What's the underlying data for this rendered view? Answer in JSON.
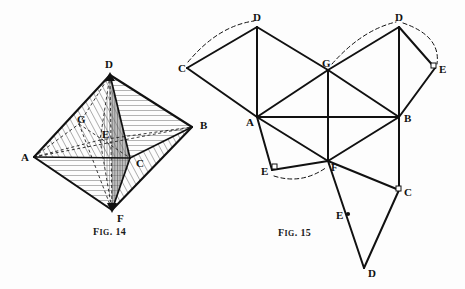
{
  "page": {
    "background_color": "#fdfdfd",
    "ink_color": "#111111",
    "width": 465,
    "height": 289
  },
  "figures": [
    {
      "id": "fig14",
      "caption": "Fig. 14",
      "caption_prefix": "F",
      "caption_small": "IG",
      "caption_suffix": ". 14",
      "caption_x": 115,
      "caption_y": 231,
      "description": "Octahedron drawn in perspective with hatched faces and hidden edges dashed",
      "type": "octahedron-perspective",
      "vertices": [
        {
          "label": "A",
          "x": 34,
          "y": 157,
          "label_x": 21,
          "label_y": 161,
          "visible": true
        },
        {
          "label": "B",
          "x": 192,
          "y": 127,
          "label_x": 200,
          "label_y": 129,
          "visible": true
        },
        {
          "label": "C",
          "x": 130,
          "y": 158,
          "label_x": 136,
          "label_y": 167,
          "visible": true
        },
        {
          "label": "D",
          "x": 110,
          "y": 75,
          "label_x": 106,
          "label_y": 69,
          "visible": true
        },
        {
          "label": "E",
          "x": 100,
          "y": 140,
          "label_x": 103,
          "label_y": 137,
          "visible": false
        },
        {
          "label": "F",
          "x": 112,
          "y": 210,
          "label_x": 117,
          "label_y": 221,
          "visible": true
        },
        {
          "label": "G",
          "x": 79,
          "y": 124,
          "label_x": 80,
          "label_y": 122,
          "visible": false
        }
      ],
      "solid_edges": [
        [
          "A",
          "D"
        ],
        [
          "D",
          "B"
        ],
        [
          "A",
          "F"
        ],
        [
          "F",
          "B"
        ],
        [
          "A",
          "C"
        ],
        [
          "C",
          "B"
        ],
        [
          "D",
          "C"
        ],
        [
          "C",
          "F"
        ]
      ],
      "hidden_edges": [
        [
          "A",
          "B"
        ],
        [
          "D",
          "F"
        ],
        [
          "A",
          "E"
        ],
        [
          "E",
          "B"
        ],
        [
          "D",
          "E"
        ],
        [
          "E",
          "F"
        ],
        [
          "A",
          "G"
        ],
        [
          "G",
          "C"
        ],
        [
          "D",
          "G"
        ],
        [
          "G",
          "F"
        ]
      ],
      "hatched_faces": [
        "A-D-C",
        "D-C-B",
        "A-C-F",
        "C-F-B"
      ]
    },
    {
      "id": "fig15",
      "caption": "Fig. 15",
      "caption_prefix": "F",
      "caption_small": "IG",
      "caption_suffix": ". 15",
      "caption_x": 278,
      "caption_y": 232,
      "description": "Unfolded net of the octahedron made of triangles, with dashed arcs indicating folding/joining of coincident vertices",
      "type": "net-triangulation",
      "vertices": [
        {
          "label": "C",
          "x": 187,
          "y": 68,
          "label_x": 180,
          "label_y": 71,
          "id": "C_left"
        },
        {
          "label": "D",
          "x": 257,
          "y": 27,
          "label_x": 254,
          "label_y": 22,
          "id": "D_topleft"
        },
        {
          "label": "G",
          "x": 328,
          "y": 70,
          "label_x": 325,
          "label_y": 67,
          "id": "G_mid"
        },
        {
          "label": "D",
          "x": 399,
          "y": 27,
          "label_x": 396,
          "label_y": 22,
          "id": "D_topright"
        },
        {
          "label": "E",
          "x": 435,
          "y": 68,
          "label_x": 440,
          "label_y": 73,
          "id": "E_right"
        },
        {
          "label": "A",
          "x": 257,
          "y": 117,
          "label_x": 248,
          "label_y": 124,
          "id": "A_mid"
        },
        {
          "label": "B",
          "x": 399,
          "y": 117,
          "label_x": 405,
          "label_y": 121,
          "id": "B_mid"
        },
        {
          "label": "F",
          "x": 328,
          "y": 161,
          "label_x": 331,
          "label_y": 170,
          "id": "F_mid"
        },
        {
          "label": "E",
          "x": 272,
          "y": 170,
          "label_x": 262,
          "label_y": 176,
          "id": "E_left"
        },
        {
          "label": "C",
          "x": 399,
          "y": 190,
          "label_x": 405,
          "label_y": 195,
          "id": "C_right"
        },
        {
          "label": "E",
          "x": 348,
          "y": 214,
          "label_x": 338,
          "label_y": 217,
          "id": "E_bottom"
        },
        {
          "label": "D",
          "x": 364,
          "y": 268,
          "label_x": 368,
          "label_y": 276,
          "id": "D_bottom"
        }
      ],
      "solid_edges": [
        [
          "C_left",
          "D_topleft"
        ],
        [
          "C_left",
          "A_mid"
        ],
        [
          "D_topleft",
          "A_mid"
        ],
        [
          "D_topleft",
          "G_mid"
        ],
        [
          "G_mid",
          "A_mid"
        ],
        [
          "G_mid",
          "D_topright"
        ],
        [
          "G_mid",
          "B_mid"
        ],
        [
          "G_mid",
          "F_mid"
        ],
        [
          "D_topright",
          "B_mid"
        ],
        [
          "D_topright",
          "E_right"
        ],
        [
          "E_right",
          "B_mid"
        ],
        [
          "A_mid",
          "B_mid"
        ],
        [
          "A_mid",
          "F_mid"
        ],
        [
          "A_mid",
          "E_left"
        ],
        [
          "E_left",
          "F_mid"
        ],
        [
          "F_mid",
          "B_mid"
        ],
        [
          "F_mid",
          "C_right"
        ],
        [
          "F_mid",
          "D_bottom"
        ],
        [
          "B_mid",
          "C_right"
        ],
        [
          "C_right",
          "D_bottom"
        ]
      ],
      "dashed_arcs": [
        {
          "from": "C_left",
          "to": "D_topleft",
          "note": "join arc above C-D"
        },
        {
          "from": "G_mid",
          "to": "D_topright",
          "note": "join arc above G-D"
        },
        {
          "from": "D_topright",
          "to": "E_right",
          "note": "join arc right of D-E"
        },
        {
          "from": "E_left",
          "to": "F_mid",
          "note": "join arc below E-F"
        }
      ]
    }
  ]
}
